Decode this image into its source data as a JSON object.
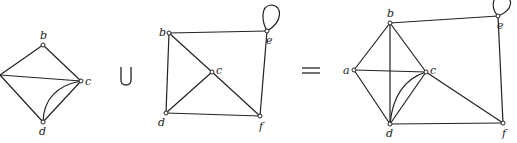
{
  "figure": {
    "operator_union": "∪",
    "operator_equals": "="
  },
  "graph1": {
    "nodes": [
      {
        "id": "a",
        "label": "",
        "x": 0,
        "y": 75
      },
      {
        "id": "b",
        "label": "b",
        "x": 43,
        "y": 45
      },
      {
        "id": "c",
        "label": "c",
        "x": 81,
        "y": 81
      },
      {
        "id": "d",
        "label": "d",
        "x": 43,
        "y": 122
      }
    ],
    "edges": [
      [
        "a",
        "b"
      ],
      [
        "a",
        "c"
      ],
      [
        "a",
        "d"
      ],
      [
        "b",
        "c"
      ],
      [
        "c",
        "d"
      ],
      [
        "c",
        "d",
        "curved"
      ]
    ]
  },
  "graph2": {
    "nodes": [
      {
        "id": "b",
        "label": "b",
        "x": 169,
        "y": 33
      },
      {
        "id": "c",
        "label": "c",
        "x": 212,
        "y": 72
      },
      {
        "id": "d",
        "label": "d",
        "x": 166,
        "y": 113
      },
      {
        "id": "e",
        "label": "e",
        "x": 267,
        "y": 31
      },
      {
        "id": "f",
        "label": "f",
        "x": 260,
        "y": 116
      }
    ],
    "edges": [
      [
        "b",
        "e"
      ],
      [
        "b",
        "d"
      ],
      [
        "b",
        "c"
      ],
      [
        "c",
        "f"
      ],
      [
        "c",
        "d"
      ],
      [
        "d",
        "f"
      ],
      [
        "e",
        "f"
      ],
      [
        "e",
        "e",
        "loop"
      ]
    ]
  },
  "graph3": {
    "nodes": [
      {
        "id": "a",
        "label": "a",
        "x": 354,
        "y": 70
      },
      {
        "id": "b",
        "label": "b",
        "x": 390,
        "y": 23
      },
      {
        "id": "c",
        "label": "c",
        "x": 426,
        "y": 72
      },
      {
        "id": "d",
        "label": "d",
        "x": 390,
        "y": 124
      },
      {
        "id": "e",
        "label": "e",
        "x": 498,
        "y": 16
      },
      {
        "id": "f",
        "label": "f",
        "x": 503,
        "y": 123
      }
    ],
    "edges": [
      [
        "a",
        "b"
      ],
      [
        "a",
        "c"
      ],
      [
        "a",
        "d"
      ],
      [
        "b",
        "c"
      ],
      [
        "b",
        "d"
      ],
      [
        "b",
        "e"
      ],
      [
        "c",
        "d"
      ],
      [
        "c",
        "d",
        "curved"
      ],
      [
        "c",
        "f"
      ],
      [
        "d",
        "f"
      ],
      [
        "e",
        "f"
      ],
      [
        "e",
        "e",
        "loop"
      ]
    ]
  }
}
